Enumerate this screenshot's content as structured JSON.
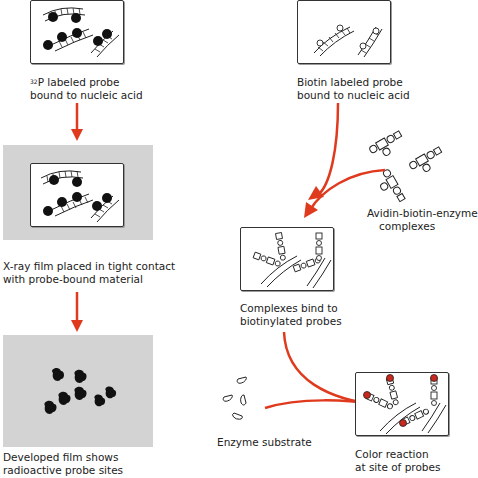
{
  "colors": {
    "arrow": "#e03a1e",
    "film_gray": "#d3d3d3",
    "outline": "#333333",
    "color_reaction_red": "#c8281e"
  },
  "left_column": {
    "step1": {
      "label_sup": "32",
      "label_line1": "P labeled probe",
      "label_line2": "bound to nucleic acid"
    },
    "step2": {
      "label_line1": "X-ray film placed in tight contact",
      "label_line2": "with probe-bound material"
    },
    "step3": {
      "label_line1": "Developed film shows",
      "label_line2": "radioactive probe sites"
    }
  },
  "right_column": {
    "step1": {
      "label_line1": "Biotin labeled probe",
      "label_line2": "bound to nucleic acid"
    },
    "reagent1": {
      "label_line1": "Avidin-biotin-enzyme",
      "label_line2": "complexes"
    },
    "step2": {
      "label_line1": "Complexes bind to",
      "label_line2": "biotinylated probes"
    },
    "reagent2": {
      "label": "Enzyme substrate"
    },
    "step3": {
      "label_line1": "Color reaction",
      "label_line2": "at site of probes"
    }
  }
}
